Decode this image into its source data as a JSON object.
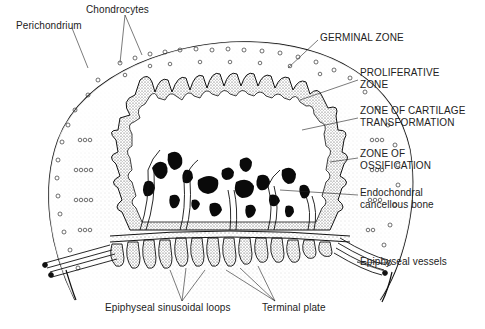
{
  "figure": {
    "colors": {
      "ink": "#111111",
      "stipple": "#555555",
      "background": "#ffffff"
    }
  },
  "labels": {
    "chondrocytes": "Chondrocytes",
    "perichondrium": "Perichondrium",
    "germinal_zone": "GERMINAL ZONE",
    "proliferative_zone": {
      "line1": "PROLIFERATIVE",
      "line2": "ZONE"
    },
    "cartilage_transformation": {
      "line1": "ZONE OF CARTILAGE",
      "line2": "TRANSFORMATION"
    },
    "ossification": {
      "line1": "ZONE OF",
      "line2": "OSSIFICATION"
    },
    "cancellous_bone": {
      "line1": "Endochondral",
      "line2": "cancellous bone"
    },
    "epiphyseal_vessels": "Epiphyseal vessels",
    "sinusoidal_loops": "Epiphyseal sinusoidal loops",
    "terminal_plate": "Terminal plate"
  }
}
